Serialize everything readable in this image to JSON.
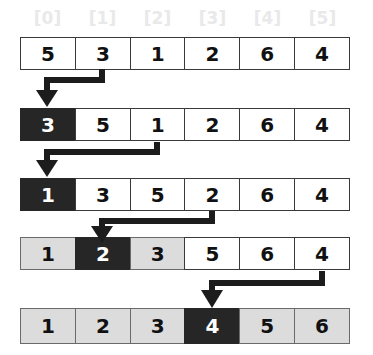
{
  "figure": {
    "index_labels": [
      "[0]",
      "[1]",
      "[2]",
      "[3]",
      "[4]",
      "[5]"
    ],
    "colors": {
      "index_label": "#e9e9e9",
      "cell_border": "#3a3a3a",
      "cell_white_bg": "#ffffff",
      "cell_gray_bg": "#dcdcdc",
      "cell_black_bg": "#262626",
      "cell_black_text": "#ffffff",
      "cell_text": "#111111",
      "arrow": "#1c1c1c",
      "background": "#ffffff"
    },
    "rows": [
      {
        "name": "row-1",
        "cells": [
          {
            "value": "5",
            "style": "white"
          },
          {
            "value": "3",
            "style": "white"
          },
          {
            "value": "1",
            "style": "white"
          },
          {
            "value": "2",
            "style": "white"
          },
          {
            "value": "6",
            "style": "white"
          },
          {
            "value": "4",
            "style": "white"
          }
        ]
      },
      {
        "name": "row-2",
        "cells": [
          {
            "value": "3",
            "style": "black"
          },
          {
            "value": "5",
            "style": "white"
          },
          {
            "value": "1",
            "style": "white"
          },
          {
            "value": "2",
            "style": "white"
          },
          {
            "value": "6",
            "style": "white"
          },
          {
            "value": "4",
            "style": "white"
          }
        ]
      },
      {
        "name": "row-3",
        "cells": [
          {
            "value": "1",
            "style": "black"
          },
          {
            "value": "3",
            "style": "white"
          },
          {
            "value": "5",
            "style": "white"
          },
          {
            "value": "2",
            "style": "white"
          },
          {
            "value": "6",
            "style": "white"
          },
          {
            "value": "4",
            "style": "white"
          }
        ]
      },
      {
        "name": "row-4",
        "cells": [
          {
            "value": "1",
            "style": "gray"
          },
          {
            "value": "2",
            "style": "black"
          },
          {
            "value": "3",
            "style": "gray"
          },
          {
            "value": "5",
            "style": "white"
          },
          {
            "value": "6",
            "style": "white"
          },
          {
            "value": "4",
            "style": "white"
          }
        ]
      },
      {
        "name": "row-5",
        "cells": [
          {
            "value": "1",
            "style": "gray"
          },
          {
            "value": "2",
            "style": "gray"
          },
          {
            "value": "3",
            "style": "gray"
          },
          {
            "value": "4",
            "style": "black"
          },
          {
            "value": "5",
            "style": "gray"
          },
          {
            "value": "6",
            "style": "gray"
          }
        ]
      }
    ],
    "arrows": [
      {
        "name": "arrow-1",
        "from_index": 1,
        "to_index": 0,
        "between_rows": "row-1 to row-2"
      },
      {
        "name": "arrow-2",
        "from_index": 2,
        "to_index": 0,
        "between_rows": "row-2 to row-3"
      },
      {
        "name": "arrow-3",
        "from_index": 3,
        "to_index": 1,
        "between_rows": "row-3 to row-4"
      },
      {
        "name": "arrow-4",
        "from_index": 5,
        "to_index": 3,
        "between_rows": "row-4 to row-5"
      }
    ]
  }
}
